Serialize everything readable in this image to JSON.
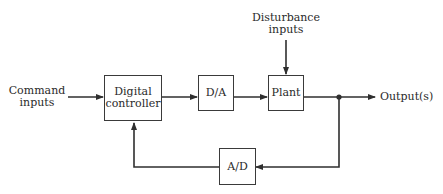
{
  "diagram": {
    "type": "block-diagram",
    "inputs": {
      "command": "Command\ninputs",
      "command_line1": "Command",
      "command_line2": "inputs",
      "disturbance_line1": "Disturbance",
      "disturbance_line2": "inputs"
    },
    "blocks": {
      "controller_line1": "Digital",
      "controller_line2": "controller",
      "dac": "D/A",
      "plant": "Plant",
      "adc": "A/D"
    },
    "outputs": {
      "output": "Output(s)"
    },
    "edges": [
      {
        "from": "Command inputs",
        "to": "Digital controller"
      },
      {
        "from": "Digital controller",
        "to": "D/A"
      },
      {
        "from": "D/A",
        "to": "Plant"
      },
      {
        "from": "Disturbance inputs",
        "to": "Plant"
      },
      {
        "from": "Plant",
        "to": "Output(s)"
      },
      {
        "from": "Output(s)",
        "to": "A/D",
        "type": "feedback"
      },
      {
        "from": "A/D",
        "to": "Digital controller",
        "type": "feedback"
      }
    ],
    "colors": {
      "line": "#2f2f2f",
      "background": "#ffffff"
    }
  }
}
